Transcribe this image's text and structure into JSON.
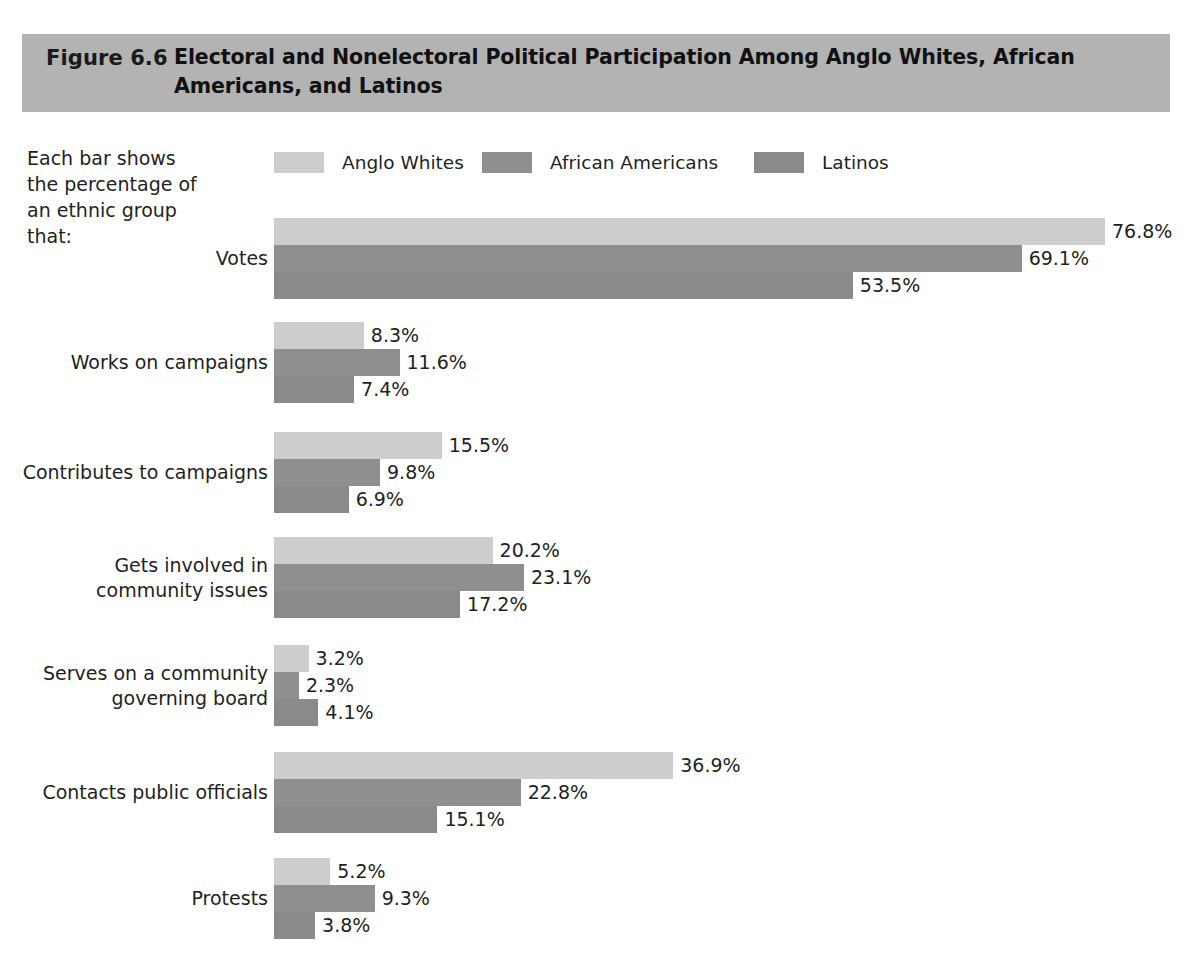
{
  "figure": {
    "number": "Figure 6.6",
    "title": "Electoral and Nonelectoral Political Participation Among Anglo Whites, African Americans, and Latinos",
    "banner_color": "#b3b3b3",
    "side_note": "Each bar shows the percentage of an ethnic group that:"
  },
  "legend": {
    "items": [
      {
        "label": "Anglo Whites",
        "color": "#cdcdcd"
      },
      {
        "label": "African Americans",
        "color": "#8f8f8f"
      },
      {
        "label": "Latinos",
        "color": "#8a8a8a"
      }
    ]
  },
  "chart_data": {
    "type": "bar",
    "orientation": "horizontal",
    "title": "Electoral and Nonelectoral Political Participation Among Anglo Whites, African Americans, and Latinos",
    "xlabel": "",
    "ylabel": "",
    "xlim": [
      0,
      80
    ],
    "grid": false,
    "legend_position": "top",
    "value_suffix": "%",
    "categories": [
      "Votes",
      "Works on campaigns",
      "Contributes to campaigns",
      "Gets involved in community issues",
      "Serves on a community governing board",
      "Contacts public officials",
      "Protests"
    ],
    "series": [
      {
        "name": "Anglo Whites",
        "color": "#cdcdcd",
        "values": [
          76.8,
          8.3,
          15.5,
          20.2,
          3.2,
          36.9,
          5.2
        ]
      },
      {
        "name": "African Americans",
        "color": "#8f8f8f",
        "values": [
          69.1,
          11.6,
          9.8,
          23.1,
          2.3,
          22.8,
          9.3
        ]
      },
      {
        "name": "Latinos",
        "color": "#8a8a8a",
        "values": [
          53.5,
          7.4,
          6.9,
          17.2,
          4.1,
          15.1,
          3.8
        ]
      }
    ],
    "labels": [
      [
        "76.8%",
        "69.1%",
        "53.5%"
      ],
      [
        "8.3%",
        "11.6%",
        "7.4%"
      ],
      [
        "15.5%",
        "9.8%",
        "6.9%"
      ],
      [
        "20.2%",
        "23.1%",
        "17.2%"
      ],
      [
        "3.2%",
        "2.3%",
        "4.1%"
      ],
      [
        "36.9%",
        "22.8%",
        "15.1%"
      ],
      [
        "5.2%",
        "9.3%",
        "3.8%"
      ]
    ],
    "category_label_lines": [
      [
        "Votes"
      ],
      [
        "Works on campaigns"
      ],
      [
        "Contributes to campaigns"
      ],
      [
        "Gets involved in",
        "community issues"
      ],
      [
        "Serves on a community",
        "governing board"
      ],
      [
        "Contacts public officials"
      ],
      [
        "Protests"
      ]
    ]
  },
  "layout": {
    "bar_origin_x": 274,
    "px_per_unit": 10.82,
    "bar_height": 27,
    "group_tops": [
      218,
      322,
      432,
      537,
      645,
      752,
      858
    ]
  }
}
